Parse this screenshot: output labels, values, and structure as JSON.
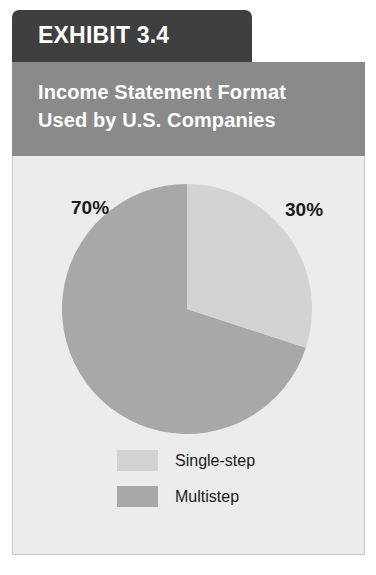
{
  "exhibit": {
    "tab_label": "EXHIBIT 3.4",
    "title_line_1": "Income Statement Format",
    "title_line_2": "Used by U.S. Companies"
  },
  "colors": {
    "tab_background": "#3f3f3f",
    "title_band_background": "#8a8a8a",
    "panel_background": "#ececec",
    "panel_border": "#c9c9c9",
    "slice_single_step": "#d3d3d3",
    "slice_multistep": "#a8a8a8",
    "label_text": "#1a1a1a",
    "header_text": "#ffffff"
  },
  "labels": {
    "multistep_percent": "70%",
    "single_step_percent": "30%"
  },
  "legend": {
    "items": [
      {
        "label": "Single-step",
        "color": "#d3d3d3"
      },
      {
        "label": "Multistep",
        "color": "#a8a8a8"
      }
    ]
  },
  "chart_data": {
    "type": "pie",
    "title": "Income Statement Format Used by U.S. Companies",
    "categories": [
      "Single-step",
      "Multistep"
    ],
    "values": [
      30,
      70
    ],
    "value_labels": [
      "30%",
      "70%"
    ],
    "units": "percent",
    "colors": [
      "#d3d3d3",
      "#a8a8a8"
    ],
    "start_angle_deg": 0,
    "direction": "clockwise",
    "legend_position": "bottom",
    "grid": false,
    "xlabel": "",
    "ylabel": ""
  }
}
